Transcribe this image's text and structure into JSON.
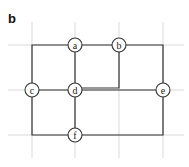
{
  "panel": {
    "label": "b"
  },
  "colors": {
    "grid": "#d9d9d9",
    "edge": "#333333",
    "node_fill": "#ffffff",
    "node_stroke": "#333333"
  },
  "grid": {
    "verticals": [
      32,
      75,
      119,
      163
    ],
    "horizontals": [
      45,
      90,
      135
    ],
    "v_extent": [
      22,
      158
    ],
    "h_extent": [
      8,
      184
    ]
  },
  "nodes": [
    {
      "id": "a",
      "label": "a",
      "x": 75,
      "y": 45
    },
    {
      "id": "b",
      "label": "b",
      "x": 119,
      "y": 45
    },
    {
      "id": "c",
      "label": "c",
      "x": 32,
      "y": 90
    },
    {
      "id": "d",
      "label": "d",
      "x": 75,
      "y": 90
    },
    {
      "id": "e",
      "label": "e",
      "x": 163,
      "y": 90
    },
    {
      "id": "f",
      "label": "f",
      "x": 75,
      "y": 135
    }
  ],
  "edges": [
    {
      "from": "a",
      "to": "b",
      "path": "M75,45 L119,45"
    },
    {
      "from": "a",
      "to": "c",
      "path": "M75,45 L32,45 L32,90"
    },
    {
      "from": "a",
      "to": "d",
      "path": "M75,45 L75,90"
    },
    {
      "from": "b",
      "to": "e",
      "path": "M119,45 L163,45 L163,90"
    },
    {
      "from": "b",
      "to": "d",
      "path": "M119,45 L119,88 L75,88"
    },
    {
      "from": "c",
      "to": "d",
      "path": "M32,90 L75,90"
    },
    {
      "from": "d",
      "to": "e",
      "path": "M75,90 L163,90"
    },
    {
      "from": "d",
      "to": "f",
      "path": "M75,90 L75,135"
    },
    {
      "from": "c",
      "to": "f",
      "path": "M32,90 L32,135 L75,135"
    },
    {
      "from": "e",
      "to": "f",
      "path": "M163,90 L163,135 L75,135"
    }
  ],
  "node_radius": 7
}
